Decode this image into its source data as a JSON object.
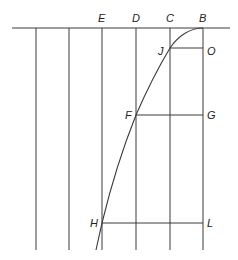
{
  "diagram": {
    "title": "",
    "top_labels": [
      {
        "id": "E",
        "text": "E",
        "x": 102
      },
      {
        "id": "D",
        "text": "D",
        "x": 136
      },
      {
        "id": "C",
        "text": "C",
        "x": 170
      },
      {
        "id": "B",
        "text": "B",
        "x": 203
      }
    ],
    "point_labels": [
      {
        "id": "J",
        "text": "J"
      },
      {
        "id": "O",
        "text": "O"
      },
      {
        "id": "F",
        "text": "F"
      },
      {
        "id": "G",
        "text": "G"
      },
      {
        "id": "H",
        "text": "H"
      },
      {
        "id": "L",
        "text": "L"
      }
    ],
    "horizontal_baseline": {
      "y": 28,
      "x1": 12,
      "x2": 230
    },
    "vertical_lines_x": [
      36,
      69,
      102,
      136,
      170,
      203
    ],
    "vertical_bottom_y": 250,
    "horizontal_segments": [
      {
        "name": "JO",
        "y": 48,
        "x1": 170,
        "x2": 203
      },
      {
        "name": "FG",
        "y": 115,
        "x1": 136,
        "x2": 203
      },
      {
        "name": "HL",
        "y": 223,
        "x1": 102,
        "x2": 203
      }
    ],
    "curve": "parabolic curve from B through J, F, H",
    "colors": {
      "line": "#3a3a3a",
      "text": "#222222",
      "background": "#ffffff"
    }
  }
}
